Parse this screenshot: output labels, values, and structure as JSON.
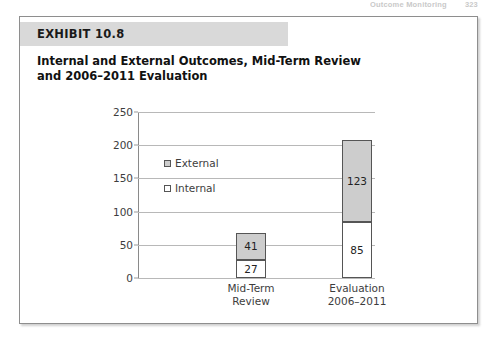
{
  "running_head": {
    "text": "Outcome Monitoring",
    "page_number": "323"
  },
  "exhibit": {
    "badge_label": "EXHIBIT 10.8",
    "title_line_1": "Internal and External Outcomes, Mid-Term Review",
    "title_line_2": "and 2006–2011 Evaluation"
  },
  "colors": {
    "external_fill": "#cdcdcd",
    "internal_fill": "#ffffff",
    "bar_border": "#555555",
    "gridline": "#b8b8b8",
    "badge_background": "#d9d9d9"
  },
  "chart_data": {
    "type": "bar",
    "subtype": "stacked",
    "title": "Internal and External Outcomes, Mid-Term Review and 2006–2011 Evaluation",
    "xlabel": "",
    "ylabel": "",
    "ylim": [
      0,
      250
    ],
    "yticks": [
      0,
      50,
      100,
      150,
      200,
      250
    ],
    "ytick_labels": [
      "0",
      "50",
      "100",
      "150",
      "200",
      "250"
    ],
    "grid": true,
    "legend_position": "inside-upper-left",
    "categories": [
      "Mid-Term Review",
      "Evaluation 2006–2011"
    ],
    "category_lines": [
      [
        "Mid-Term",
        "Review"
      ],
      [
        "Evaluation",
        "2006–2011"
      ]
    ],
    "series": [
      {
        "name": "Internal",
        "values": [
          27,
          85
        ],
        "labels": [
          "27",
          "85"
        ]
      },
      {
        "name": "External",
        "values": [
          41,
          123
        ],
        "labels": [
          "41",
          "123"
        ]
      }
    ],
    "stack_order": [
      "Internal",
      "External"
    ],
    "totals": [
      68,
      208
    ]
  },
  "legend": {
    "items": [
      {
        "label": "External",
        "swatch": "external"
      },
      {
        "label": "Internal",
        "swatch": "internal"
      }
    ]
  }
}
